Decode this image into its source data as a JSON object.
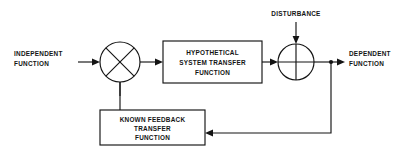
{
  "diagram": {
    "canvas": {
      "width": 406,
      "height": 162
    },
    "colors": {
      "background": "#ffffff",
      "line": "#141414",
      "text": "#141414"
    },
    "labels": {
      "input": {
        "line1": "INDEPENDENT",
        "line2": "FUNCTION"
      },
      "output": {
        "line1": "DEPENDENT",
        "line2": "FUNCTION"
      },
      "disturbance": {
        "line1": "DISTURBANCE"
      }
    },
    "blocks": [
      {
        "id": "forward-block",
        "name": "hypothetical-system-transfer-function-block",
        "line1": "HYPOTHETICAL",
        "line2": "SYSTEM TRANSFER",
        "line3": "FUNCTION"
      },
      {
        "id": "feedback-block",
        "name": "known-feedback-transfer-function-block",
        "line1": "KNOWN FEEDBACK",
        "line2": "TRANSFER",
        "line3": "FUNCTION"
      }
    ],
    "junctions": [
      {
        "id": "summing-junction-left",
        "symbol": "x-cross",
        "cx": 120,
        "cy": 62,
        "r": 20
      },
      {
        "id": "summing-junction-right",
        "symbol": "plus-cross",
        "cx": 296,
        "cy": 62,
        "r": 18
      }
    ]
  }
}
